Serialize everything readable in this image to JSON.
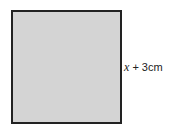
{
  "diagram": {
    "shape": "square",
    "fill_color": "#d4d4d4",
    "border_color": "#222222",
    "side_label": {
      "variable": "x",
      "rest": " + 3cm"
    }
  }
}
